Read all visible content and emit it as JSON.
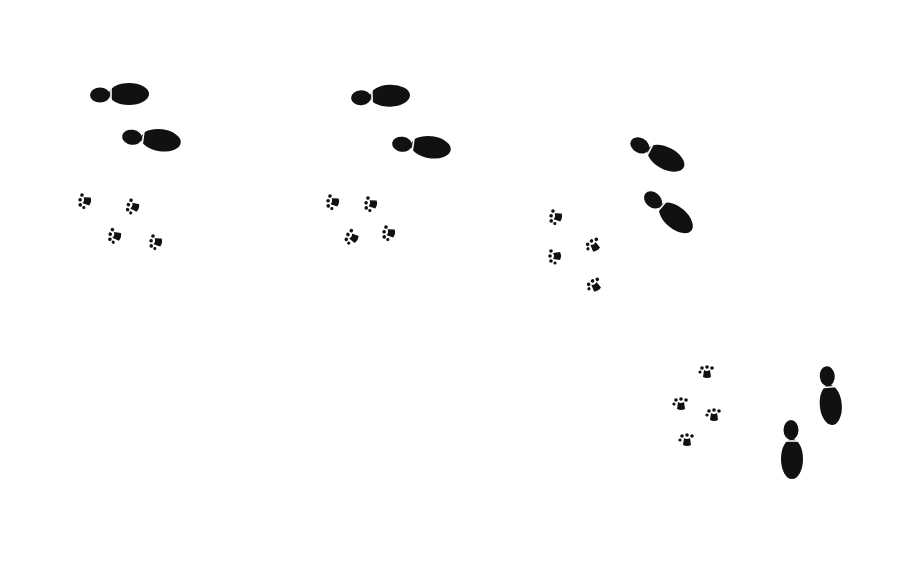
{
  "illustration": {
    "subject": "Shoe prints and paw prints walking together",
    "background": "#ffffff",
    "ink": "#111111",
    "groups": [
      {
        "name": "group-1",
        "shoes": [
          {
            "x": 120,
            "y": 94,
            "angle": 0
          },
          {
            "x": 152,
            "y": 139,
            "angle": 8
          }
        ],
        "paws": [
          {
            "x": 87,
            "y": 201,
            "angle": -80
          },
          {
            "x": 135,
            "y": 207,
            "angle": -70
          },
          {
            "x": 117,
            "y": 236,
            "angle": -75
          },
          {
            "x": 158,
            "y": 242,
            "angle": -80
          }
        ]
      },
      {
        "name": "group-2",
        "shoes": [
          {
            "x": 381,
            "y": 96,
            "angle": -2
          },
          {
            "x": 422,
            "y": 146,
            "angle": 8
          }
        ],
        "paws": [
          {
            "x": 335,
            "y": 202,
            "angle": -80
          },
          {
            "x": 373,
            "y": 204,
            "angle": -80
          },
          {
            "x": 354,
            "y": 238,
            "angle": -60
          },
          {
            "x": 391,
            "y": 233,
            "angle": -80
          }
        ]
      },
      {
        "name": "group-3",
        "shoes": [
          {
            "x": 658,
            "y": 154,
            "angle": 28
          },
          {
            "x": 669,
            "y": 212,
            "angle": 40
          }
        ],
        "paws": [
          {
            "x": 558,
            "y": 217,
            "angle": -80
          },
          {
            "x": 557,
            "y": 256,
            "angle": -90
          },
          {
            "x": 595,
            "y": 247,
            "angle": -30
          },
          {
            "x": 596,
            "y": 287,
            "angle": -30
          }
        ]
      },
      {
        "name": "group-4",
        "shoes": [
          {
            "x": 830,
            "y": 396,
            "angle": 85
          },
          {
            "x": 792,
            "y": 450,
            "angle": 90
          }
        ],
        "paws": [
          {
            "x": 707,
            "y": 374,
            "angle": 0
          },
          {
            "x": 681,
            "y": 406,
            "angle": 0
          },
          {
            "x": 714,
            "y": 417,
            "angle": 0
          },
          {
            "x": 687,
            "y": 442,
            "angle": 0
          }
        ]
      }
    ]
  }
}
